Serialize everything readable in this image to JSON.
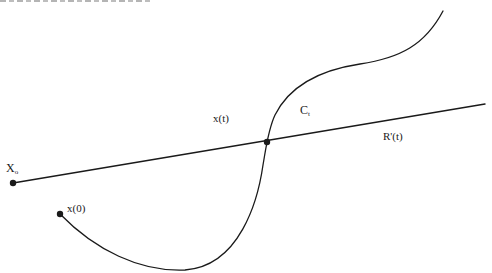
{
  "figure": {
    "type": "geometric diagram",
    "stroke_color": "#1a1a1a",
    "background": "#ffffff",
    "labels": {
      "x_origin": {
        "main": "X",
        "sub": "o"
      },
      "x_zero": "x(0)",
      "x_t": "x(t)",
      "curve": {
        "main": "C",
        "sub": "t"
      },
      "ray": "R'(t)"
    },
    "points": [
      {
        "name": "X_o",
        "x": 13,
        "y": 183
      },
      {
        "name": "x(0)",
        "x": 60,
        "y": 214
      },
      {
        "name": "intersection",
        "x": 267,
        "y": 142
      }
    ],
    "ray": {
      "from": [
        13,
        183
      ],
      "to": [
        485,
        104
      ]
    },
    "curve_path": "M 60 214 C 95 250, 140 272, 185 270 C 240 266, 258 200, 263 165 C 266 148, 268 130, 275 115 C 290 85, 320 70, 360 64 C 400 58, 425 45, 443 11"
  }
}
